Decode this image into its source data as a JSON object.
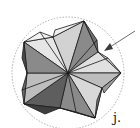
{
  "figure": {
    "label": "j.",
    "colors": {
      "circle": "#9a9a9a",
      "edge": "#1a1a1a",
      "arrow": "#6e6e6e",
      "face_light": "#e6e6e6",
      "face_mid": "#bdbdbd",
      "face_dark": "#8a8a8a",
      "face_darker": "#5e5e5e"
    }
  }
}
